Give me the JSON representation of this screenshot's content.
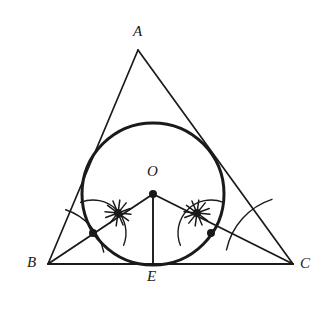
{
  "figure": {
    "type": "geometric-construction",
    "canvas": {
      "width": 335,
      "height": 310,
      "background": "#ffffff"
    },
    "stroke_color": "#1a1a1a",
    "points": {
      "A": {
        "label": "A",
        "x": 138,
        "y": 50,
        "label_x": 133,
        "label_y": 24
      },
      "B": {
        "label": "B",
        "x": 48,
        "y": 264,
        "label_x": 27,
        "label_y": 255
      },
      "C": {
        "label": "C",
        "x": 293,
        "y": 264,
        "label_x": 300,
        "label_y": 256
      },
      "O": {
        "label": "O",
        "x": 153,
        "y": 194,
        "label_x": 147,
        "label_y": 164
      },
      "E": {
        "label": "E",
        "x": 153,
        "y": 265,
        "label_x": 147,
        "label_y": 269
      }
    },
    "incircle": {
      "cx": 153,
      "cy": 194,
      "r": 71,
      "stroke_width": 3
    },
    "segments": [
      {
        "name": "side-AB",
        "x1": 138,
        "y1": 50,
        "x2": 48,
        "y2": 264
      },
      {
        "name": "side-AC",
        "x1": 138,
        "y1": 50,
        "x2": 293,
        "y2": 264
      },
      {
        "name": "side-BC",
        "x1": 48,
        "y1": 264,
        "x2": 293,
        "y2": 264
      },
      {
        "name": "bisector-from-B",
        "x1": 48,
        "y1": 264,
        "x2": 153,
        "y2": 194
      },
      {
        "name": "bisector-from-C",
        "x1": 293,
        "y1": 264,
        "x2": 153,
        "y2": 194
      },
      {
        "name": "radius-OE",
        "x1": 153,
        "y1": 194,
        "x2": 153,
        "y2": 265
      }
    ],
    "construction_marks": {
      "star_left": {
        "cx": 118,
        "cy": 213,
        "r": 13
      },
      "star_right": {
        "cx": 197,
        "cy": 213,
        "r": 13
      },
      "dot_left_on_circle": {
        "cx": 93,
        "cy": 233,
        "r": 4
      },
      "dot_right_on_circle": {
        "cx": 211,
        "cy": 233,
        "r": 4
      },
      "arcs": [
        {
          "name": "arc-at-B",
          "cx": 48,
          "cy": 264,
          "r": 57
        },
        {
          "name": "arc-at-C",
          "cx": 293,
          "cy": 264,
          "r": 68
        },
        {
          "name": "arc-left-upper",
          "cx": 93,
          "cy": 233,
          "r": 33
        },
        {
          "name": "arc-right-upper",
          "cx": 211,
          "cy": 233,
          "r": 33
        }
      ]
    }
  }
}
